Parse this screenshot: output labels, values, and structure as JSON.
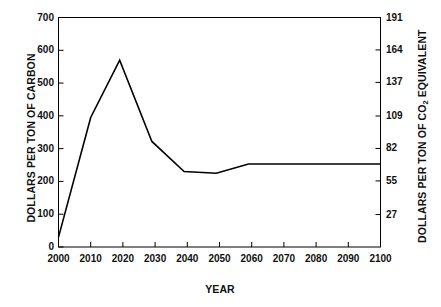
{
  "chart_data": {
    "type": "line",
    "title": "",
    "subtitle": "",
    "xlabel": "YEAR",
    "ylabel": "DOLLARS PER TON OF CARBON",
    "ylabel_right_parts": {
      "before": "DOLLARS PER TON OF CO",
      "subscript": "2",
      "after": " EQUIVALENT"
    },
    "ylabel_right": "DOLLARS PER TON OF CO2 EQUIVALENT",
    "xlim": [
      2000,
      2100
    ],
    "ylim": [
      0,
      700
    ],
    "ylim_right": [
      0,
      191
    ],
    "grid": false,
    "legend": false,
    "xticks": [
      2000,
      2010,
      2020,
      2030,
      2040,
      2050,
      2060,
      2070,
      2080,
      2090,
      2100
    ],
    "xtick_labels": [
      "2000",
      "2010",
      "2020",
      "2030",
      "2040",
      "2050",
      "2060",
      "2070",
      "2080",
      "2090",
      "2100"
    ],
    "yticks_left": [
      0,
      100,
      200,
      300,
      400,
      500,
      600,
      700
    ],
    "ytick_labels_left": [
      "0",
      "100",
      "200",
      "300",
      "400",
      "500",
      "600",
      "700"
    ],
    "yticks_right": [
      0,
      27,
      55,
      82,
      109,
      137,
      164,
      191
    ],
    "ytick_labels_right": [
      "27",
      "55",
      "82",
      "109",
      "137",
      "164",
      "191"
    ],
    "line_color": "#000000",
    "line_width": 1.6,
    "x": [
      2000,
      2010,
      2019,
      2029,
      2039,
      2049,
      2059,
      2070,
      2080,
      2090,
      2100
    ],
    "values": [
      30,
      395,
      570,
      322,
      230,
      225,
      253,
      253,
      253,
      253,
      253
    ],
    "series": [
      {
        "name": "Carbon price",
        "x": [
          2000,
          2010,
          2019,
          2029,
          2039,
          2049,
          2059,
          2070,
          2080,
          2090,
          2100
        ],
        "values": [
          30,
          395,
          570,
          322,
          230,
          225,
          253,
          253,
          253,
          253,
          253
        ]
      }
    ],
    "annotations": []
  }
}
